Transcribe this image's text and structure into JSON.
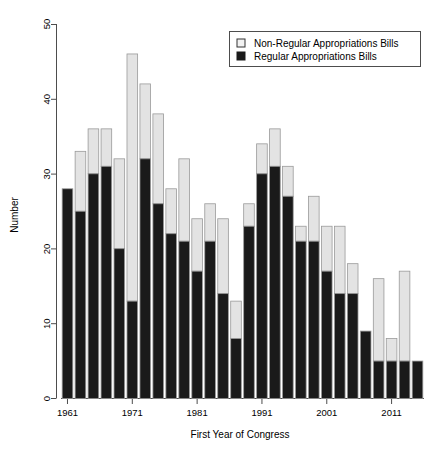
{
  "chart_data": {
    "type": "bar",
    "subtype": "stacked-bar",
    "title": "",
    "xlabel": "First Year of Congress",
    "ylabel": "Number",
    "ylim": [
      0,
      50
    ],
    "yticks": [
      0,
      10,
      20,
      30,
      40,
      50
    ],
    "xticks_labeled": [
      "1961",
      "1971",
      "1981",
      "1991",
      "2001",
      "2011"
    ],
    "grid": false,
    "legend_position": "top-right",
    "categories": [
      "1961",
      "1963",
      "1965",
      "1967",
      "1969",
      "1971",
      "1973",
      "1975",
      "1977",
      "1979",
      "1981",
      "1983",
      "1985",
      "1987",
      "1989",
      "1991",
      "1993",
      "1995",
      "1997",
      "1999",
      "2001",
      "2003",
      "2005",
      "2007",
      "2009",
      "2011",
      "2013",
      "2015"
    ],
    "series": [
      {
        "name": "Regular Appropriations Bills",
        "color": "#1a1a1a",
        "values": [
          28,
          25,
          30,
          31,
          20,
          13,
          32,
          26,
          22,
          21,
          17,
          21,
          14,
          8,
          23,
          30,
          31,
          27,
          21,
          21,
          17,
          14,
          14,
          9,
          5,
          5,
          5,
          5
        ]
      },
      {
        "name": "Non-Regular Appropriations Bills",
        "color": "#e3e3e3",
        "values": [
          0,
          8,
          6,
          5,
          12,
          33,
          10,
          12,
          6,
          11,
          7,
          5,
          10,
          5,
          3,
          4,
          5,
          4,
          2,
          6,
          6,
          9,
          4,
          0,
          11,
          3,
          12,
          0
        ]
      }
    ],
    "totals": [
      28,
      33,
      36,
      36,
      32,
      46,
      42,
      38,
      28,
      32,
      24,
      26,
      24,
      13,
      26,
      34,
      36,
      31,
      23,
      27,
      23,
      23,
      18,
      9,
      16,
      8,
      17,
      5
    ]
  },
  "legend": {
    "entries": [
      {
        "label": "Non-Regular Appropriations Bills",
        "swatch": "open-square",
        "color": "#f2f2f2"
      },
      {
        "label": "Regular Appropriations Bills",
        "swatch": "filled-square",
        "color": "#1a1a1a"
      }
    ]
  },
  "axes": {
    "y": {
      "title": "Number",
      "labels": [
        "50",
        "40",
        "30",
        "20",
        "10",
        "0"
      ]
    },
    "x": {
      "title": "First Year of Congress",
      "labels": [
        "1961",
        "1971",
        "1981",
        "1991",
        "2001",
        "2011"
      ]
    }
  }
}
